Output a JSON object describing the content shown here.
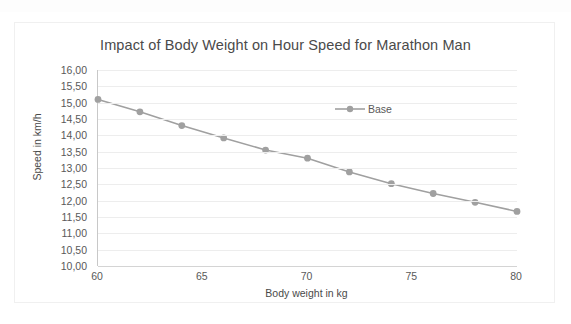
{
  "chart_data": {
    "type": "line",
    "title": "Impact of Body Weight on Hour Speed for Marathon Man",
    "xlabel": "Body weight in kg",
    "ylabel": "Speed in km/h",
    "x": [
      60,
      62,
      64,
      66,
      68,
      70,
      72,
      74,
      76,
      78,
      80
    ],
    "series": [
      {
        "name": "Base",
        "values": [
          15.1,
          14.72,
          14.3,
          13.92,
          13.55,
          13.3,
          12.88,
          12.52,
          12.22,
          11.95,
          11.67
        ],
        "color": "#a0a0a0",
        "marker": "circle"
      }
    ],
    "xlim": [
      60,
      80
    ],
    "ylim": [
      10.0,
      16.0
    ],
    "x_ticks": [
      60,
      65,
      70,
      75,
      80
    ],
    "x_tick_labels": [
      "60",
      "65",
      "70",
      "75",
      "80"
    ],
    "y_ticks": [
      10.0,
      10.5,
      11.0,
      11.5,
      12.0,
      12.5,
      13.0,
      13.5,
      14.0,
      14.5,
      15.0,
      15.5,
      16.0
    ],
    "y_tick_labels": [
      "10,00",
      "10,50",
      "11,00",
      "11,50",
      "12,00",
      "12,50",
      "13,00",
      "13,50",
      "14,00",
      "14,50",
      "15,00",
      "15,50",
      "16,00"
    ],
    "grid": "horizontal",
    "legend_position": "inside-top-right",
    "legend_entries": [
      "Base"
    ]
  },
  "colors": {
    "series": "#a0a0a0",
    "gridline": "#ededed",
    "axis": "#c8c8c8",
    "text": "#595959",
    "title_text": "#4a4a4a",
    "frame_border": "#f0f0f0",
    "background": "#ffffff"
  }
}
